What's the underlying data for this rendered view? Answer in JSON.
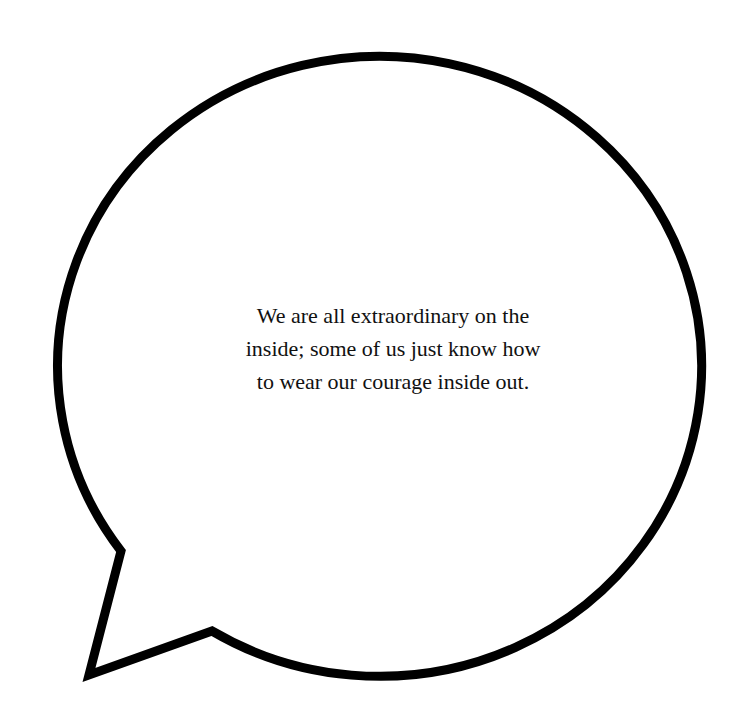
{
  "bubble": {
    "type": "speech-bubble",
    "fill": "#ffffff",
    "stroke": "#000000",
    "stroke_width": 9
  },
  "quote": {
    "lines": [
      "We are all extraordinary on the",
      "inside; some of us just know how",
      "to wear our courage inside out."
    ]
  }
}
